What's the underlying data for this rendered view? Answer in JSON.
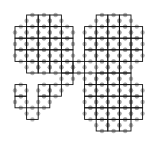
{
  "diagram": {
    "type": "grid-knot-figure",
    "colors": {
      "grid_line": "#111111",
      "dot": "#9a9a9a",
      "background": "#ffffff"
    },
    "origin": [
      15,
      15
    ],
    "cell_size": 11.6,
    "regions": [
      {
        "name": "top-left-octagon",
        "cells": [
          [
            1,
            0
          ],
          [
            2,
            0
          ],
          [
            3,
            0
          ],
          [
            0,
            1
          ],
          [
            1,
            1
          ],
          [
            2,
            1
          ],
          [
            3,
            1
          ],
          [
            4,
            1
          ],
          [
            0,
            2
          ],
          [
            1,
            2
          ],
          [
            2,
            2
          ],
          [
            3,
            2
          ],
          [
            4,
            2
          ],
          [
            0,
            3
          ],
          [
            1,
            3
          ],
          [
            2,
            3
          ],
          [
            3,
            3
          ],
          [
            4,
            3
          ],
          [
            1,
            4
          ],
          [
            2,
            4
          ],
          [
            3,
            4
          ],
          [
            4,
            4
          ]
        ]
      },
      {
        "name": "top-right-octagon",
        "cells": [
          [
            7,
            0
          ],
          [
            8,
            0
          ],
          [
            9,
            0
          ],
          [
            6,
            1
          ],
          [
            7,
            1
          ],
          [
            8,
            1
          ],
          [
            9,
            1
          ],
          [
            10,
            1
          ],
          [
            6,
            2
          ],
          [
            7,
            2
          ],
          [
            8,
            2
          ],
          [
            9,
            2
          ],
          [
            10,
            2
          ],
          [
            6,
            3
          ],
          [
            7,
            3
          ],
          [
            8,
            3
          ],
          [
            9,
            3
          ],
          [
            10,
            3
          ],
          [
            7,
            4
          ],
          [
            8,
            4
          ],
          [
            9,
            4
          ]
        ]
      },
      {
        "name": "bottom-right-octagon",
        "cells": [
          [
            6,
            5
          ],
          [
            7,
            5
          ],
          [
            8,
            5
          ],
          [
            9,
            5
          ],
          [
            6,
            6
          ],
          [
            7,
            6
          ],
          [
            8,
            6
          ],
          [
            9,
            6
          ],
          [
            10,
            6
          ],
          [
            6,
            7
          ],
          [
            7,
            7
          ],
          [
            8,
            7
          ],
          [
            9,
            7
          ],
          [
            10,
            7
          ],
          [
            6,
            8
          ],
          [
            7,
            8
          ],
          [
            8,
            8
          ],
          [
            9,
            8
          ],
          [
            10,
            8
          ],
          [
            7,
            9
          ],
          [
            8,
            9
          ],
          [
            9,
            9
          ]
        ]
      },
      {
        "name": "hook-path",
        "cells": [
          [
            5,
            4
          ],
          [
            4,
            5
          ],
          [
            3,
            6
          ],
          [
            2,
            6
          ],
          [
            2,
            7
          ],
          [
            1,
            8
          ],
          [
            0,
            6
          ],
          [
            0,
            7
          ]
        ]
      }
    ]
  }
}
